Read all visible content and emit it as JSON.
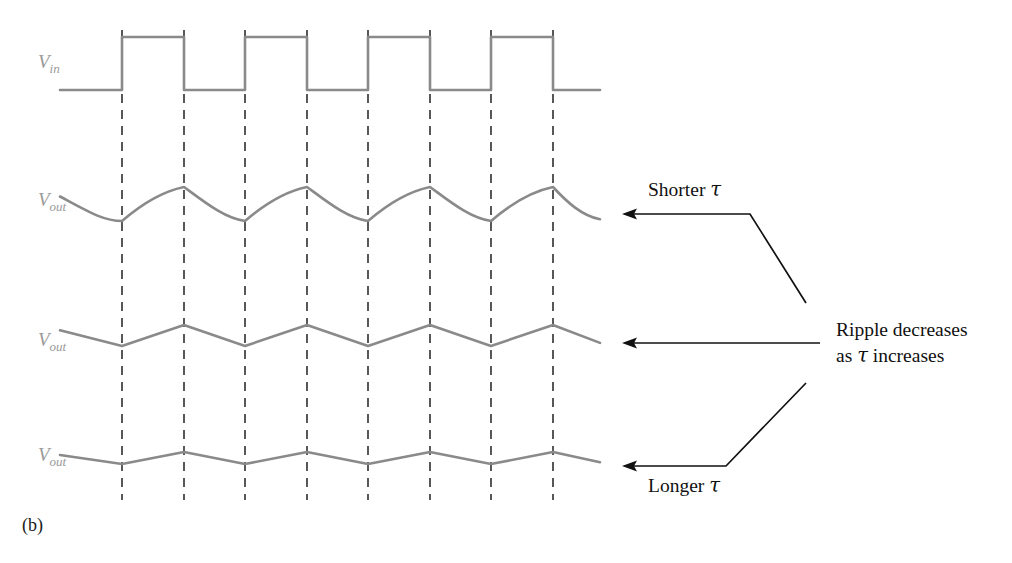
{
  "figure": {
    "caption": "(b)",
    "background_color": "#ffffff",
    "waveform_color": "#8a8a8a",
    "gridline_color": "#3b3b3b",
    "annotation_color": "#111111",
    "label_color": "#9a9a9a"
  },
  "signals": {
    "input": {
      "name": "V",
      "subscript": "in",
      "label_x": 38,
      "label_y": 68
    },
    "outputs": [
      {
        "name": "V",
        "subscript": "out",
        "label_x": 38,
        "label_y": 206,
        "ripple": "largest",
        "shape": "exponential"
      },
      {
        "name": "V",
        "subscript": "out",
        "label_x": 38,
        "label_y": 346,
        "ripple": "medium",
        "shape": "triangular"
      },
      {
        "name": "V",
        "subscript": "out",
        "label_x": 38,
        "label_y": 461,
        "ripple": "smallest",
        "shape": "triangular-shallow"
      }
    ]
  },
  "annotations": [
    {
      "id": "shorter-tau",
      "text_before": "Shorter ",
      "tau": "τ",
      "text_after": "",
      "text_x": 648,
      "text_y": 196,
      "anchor": "start"
    },
    {
      "id": "ripple-decreases-line1",
      "text_before": "Ripple decreases",
      "tau": "",
      "text_after": "",
      "text_x": 836,
      "text_y": 336,
      "anchor": "start"
    },
    {
      "id": "ripple-decreases-line2",
      "text_before": "as ",
      "tau": "τ",
      "text_after": " increases",
      "text_x": 836,
      "text_y": 362,
      "anchor": "start"
    },
    {
      "id": "longer-tau",
      "text_before": "Longer ",
      "tau": "τ",
      "text_after": "",
      "text_x": 648,
      "text_y": 492,
      "anchor": "start"
    }
  ],
  "chart_data": {
    "type": "line",
    "xlabel": "",
    "ylabel": "",
    "grid": true,
    "legend_position": "right",
    "x_domain": [
      60,
      600
    ],
    "gridline_x_positions": [
      122,
      184,
      245,
      307,
      368,
      430,
      491,
      553
    ],
    "gridline_y_range": [
      30,
      500
    ],
    "series": [
      {
        "name": "Vin",
        "type": "square",
        "baseline_y": 90,
        "high_y": 37,
        "start_x": 60,
        "end_x": 600,
        "edges": [
          122,
          184,
          245,
          307,
          368,
          430,
          491,
          553
        ],
        "duty_cycle": 0.5
      },
      {
        "name": "Vout-short-tau",
        "type": "ripple-exponential",
        "mid_y": 204,
        "peak_y": 187,
        "trough_y": 221,
        "start_x": 60,
        "end_x": 600,
        "ripple_px": 34
      },
      {
        "name": "Vout-medium-tau",
        "type": "ripple-triangular",
        "mid_y": 335,
        "peak_y": 325,
        "trough_y": 346,
        "start_x": 60,
        "end_x": 600,
        "ripple_px": 21
      },
      {
        "name": "Vout-long-tau",
        "type": "ripple-triangular",
        "mid_y": 458,
        "peak_y": 452,
        "trough_y": 464,
        "start_x": 60,
        "end_x": 600,
        "ripple_px": 12
      }
    ],
    "annotation_arrows": [
      {
        "id": "arrow-shorter-tau",
        "points": "806,303 750,214 632,214",
        "tip_x": 622,
        "tip_y": 214,
        "direction": "left"
      },
      {
        "id": "arrow-ripple-middle",
        "points": "820,343 632,343",
        "tip_x": 622,
        "tip_y": 343,
        "direction": "left"
      },
      {
        "id": "arrow-longer-tau",
        "points": "806,383 726,466 632,466",
        "tip_x": 622,
        "tip_y": 466,
        "direction": "left"
      }
    ]
  }
}
